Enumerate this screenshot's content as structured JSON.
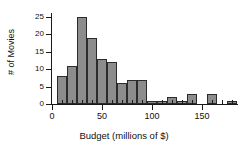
{
  "figure": {
    "kind": "statistics-histogram-figure",
    "background_color": "#ffffff",
    "bar_fill_color": "#8c8c8c",
    "bar_edge_color": "#2b2b2b",
    "axis_color": "#1a1a1a"
  },
  "chart_data": {
    "type": "bar",
    "chart_subtype": "histogram",
    "title": "",
    "xlabel": "Budget (millions of $)",
    "ylabel": "# of Movies",
    "xlim": [
      -6,
      190
    ],
    "ylim": [
      0,
      25
    ],
    "grid": false,
    "legend": null,
    "bin_width": 10,
    "x_ticks": [
      0,
      50,
      100,
      150
    ],
    "x_tick_labels": [
      "0",
      "50",
      "100",
      "150"
    ],
    "x_minor_tick_step": 10,
    "y_ticks": [
      0,
      5,
      10,
      15,
      20,
      25
    ],
    "y_tick_labels": [
      "0",
      "5",
      "10",
      "15",
      "20",
      "25"
    ],
    "categories": [
      "5-15",
      "15-25",
      "25-35",
      "35-45",
      "45-55",
      "55-65",
      "65-75",
      "75-85",
      "85-95",
      "95-105",
      "105-115",
      "115-125",
      "125-135",
      "135-145",
      "145-155",
      "155-165",
      "165-175",
      "175-185"
    ],
    "bins": [
      {
        "start": 5,
        "end": 15,
        "count": 8
      },
      {
        "start": 15,
        "end": 25,
        "count": 11
      },
      {
        "start": 25,
        "end": 35,
        "count": 25
      },
      {
        "start": 35,
        "end": 45,
        "count": 19
      },
      {
        "start": 45,
        "end": 55,
        "count": 13
      },
      {
        "start": 55,
        "end": 65,
        "count": 12
      },
      {
        "start": 65,
        "end": 75,
        "count": 6
      },
      {
        "start": 75,
        "end": 85,
        "count": 7
      },
      {
        "start": 85,
        "end": 95,
        "count": 7
      },
      {
        "start": 95,
        "end": 105,
        "count": 1
      },
      {
        "start": 105,
        "end": 115,
        "count": 1
      },
      {
        "start": 115,
        "end": 125,
        "count": 2
      },
      {
        "start": 125,
        "end": 135,
        "count": 1
      },
      {
        "start": 135,
        "end": 145,
        "count": 3
      },
      {
        "start": 145,
        "end": 155,
        "count": 0
      },
      {
        "start": 155,
        "end": 165,
        "count": 3
      },
      {
        "start": 165,
        "end": 175,
        "count": 0
      },
      {
        "start": 175,
        "end": 185,
        "count": 1
      }
    ],
    "values": [
      8,
      11,
      25,
      19,
      13,
      12,
      6,
      7,
      7,
      1,
      1,
      2,
      1,
      3,
      0,
      3,
      0,
      1
    ],
    "total_count": 120,
    "peak_bin": "25-35",
    "peak_value": 25
  }
}
